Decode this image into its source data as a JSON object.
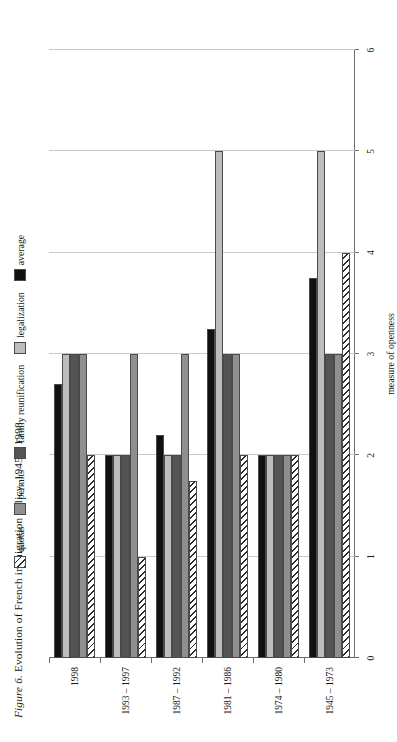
{
  "figure": {
    "label": "Figure 6.",
    "caption": "Evolution of French immigration policy, 1945 – 1998"
  },
  "legend": {
    "items": [
      {
        "label": "quotas",
        "key": "quotas",
        "swatch": "hatched-diagonal",
        "color": "#ffffff"
      },
      {
        "label": "permits",
        "key": "permits",
        "swatch": "solid",
        "color": "#8f8f8f"
      },
      {
        "label": "family reunification",
        "key": "family",
        "swatch": "solid",
        "color": "#545454"
      },
      {
        "label": "legalization",
        "key": "legalization",
        "swatch": "solid",
        "color": "#bdbdbd"
      },
      {
        "label": "average",
        "key": "average",
        "swatch": "solid",
        "color": "#111111"
      }
    ]
  },
  "axes": {
    "value_axis_title": "measure of openness",
    "value_ticks": [
      "0",
      "1",
      "2",
      "3",
      "4",
      "5",
      "6"
    ],
    "value_min": 0,
    "value_max": 6
  },
  "chart_data": {
    "type": "bar",
    "orientation": "horizontal",
    "title": "Figure 6. Evolution of French immigration policy, 1945 – 1998",
    "xlabel": "measure of openness",
    "ylabel": "",
    "xlim": [
      0,
      6
    ],
    "grid": true,
    "legend_position": "top",
    "categories": [
      "1945 – 1973",
      "1974 – 1980",
      "1981 – 1986",
      "1987 – 1992",
      "1993 – 1997",
      "1998"
    ],
    "series": [
      {
        "name": "quotas",
        "values": [
          4.0,
          2.0,
          2.0,
          1.75,
          1.0,
          2.0
        ]
      },
      {
        "name": "permits",
        "values": [
          3.0,
          2.0,
          3.0,
          3.0,
          3.0,
          3.0
        ]
      },
      {
        "name": "family reunification",
        "values": [
          3.0,
          2.0,
          3.0,
          2.0,
          2.0,
          3.0
        ]
      },
      {
        "name": "legalization",
        "values": [
          5.0,
          2.0,
          5.0,
          2.0,
          2.0,
          3.0
        ]
      },
      {
        "name": "average",
        "values": [
          3.75,
          2.0,
          3.25,
          2.2,
          2.0,
          2.7
        ]
      }
    ]
  }
}
